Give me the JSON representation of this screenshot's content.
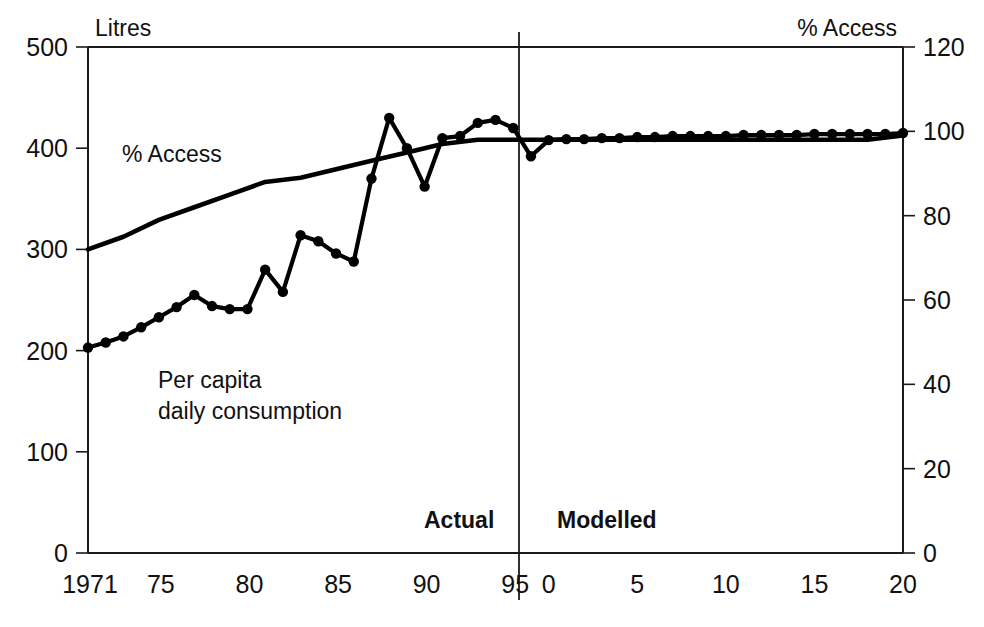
{
  "chart_data": {
    "type": "line",
    "title": "",
    "xlabel": "",
    "ylabel": "Litres",
    "y2label": "% Access",
    "ylim": [
      0,
      500
    ],
    "y2lim": [
      0,
      120
    ],
    "grid": false,
    "legend_position": "inline-annotation",
    "x_axis": {
      "actual_ticks": [
        "1971",
        "75",
        "80",
        "85",
        "90",
        "95"
      ],
      "modelled_ticks": [
        "0",
        "5",
        "10",
        "15",
        "20"
      ],
      "actual_tick_years": [
        1971,
        1975,
        1980,
        1985,
        1990,
        1995
      ],
      "modelled_tick_offsets": [
        0,
        5,
        10,
        15,
        20
      ],
      "divider_year": 1997,
      "range_years": [
        1971,
        2017
      ]
    },
    "y_axis_left": {
      "label": "Litres",
      "ticks": [
        0,
        100,
        200,
        300,
        400,
        500
      ]
    },
    "y_axis_right": {
      "label": "% Access",
      "ticks": [
        0,
        20,
        40,
        60,
        80,
        100,
        120
      ]
    },
    "annotations": [
      {
        "name": "percent-access-left",
        "text": "% Access"
      },
      {
        "name": "per-capita-line1",
        "text": "Per capita"
      },
      {
        "name": "per-capita-line2",
        "text": "daily consumption"
      },
      {
        "name": "phase-actual",
        "text": "Actual"
      },
      {
        "name": "phase-modelled",
        "text": "Modelled"
      }
    ],
    "series": [
      {
        "name": "Per capita daily consumption",
        "axis": "left",
        "unit": "Litres",
        "markers": true,
        "x": [
          1971,
          1972,
          1973,
          1974,
          1975,
          1976,
          1977,
          1978,
          1979,
          1980,
          1981,
          1982,
          1983,
          1984,
          1985,
          1986,
          1987,
          1988,
          1989,
          1990,
          1991,
          1992,
          1993,
          1994,
          1995,
          1996,
          1997,
          1998,
          1999,
          2000,
          2001,
          2002,
          2003,
          2004,
          2005,
          2006,
          2007,
          2008,
          2009,
          2010,
          2011,
          2012,
          2013,
          2014,
          2015,
          2016,
          2017
        ],
        "values": [
          203,
          208,
          214,
          223,
          233,
          243,
          255,
          244,
          241,
          241,
          280,
          258,
          314,
          308,
          296,
          288,
          370,
          430,
          400,
          362,
          410,
          412,
          425,
          428,
          420,
          392,
          408,
          409,
          409,
          410,
          410,
          411,
          411,
          412,
          412,
          412,
          412,
          413,
          413,
          413,
          413,
          414,
          414,
          414,
          414,
          414,
          415
        ]
      },
      {
        "name": "% Access",
        "axis": "right",
        "unit": "%",
        "markers": false,
        "x": [
          1971,
          1973,
          1975,
          1977,
          1979,
          1981,
          1983,
          1985,
          1987,
          1989,
          1991,
          1993,
          1995,
          1997,
          1999,
          2001,
          2003,
          2005,
          2007,
          2009,
          2011,
          2013,
          2015,
          2017
        ],
        "values": [
          72,
          75,
          79,
          82,
          85,
          88,
          89,
          91,
          93,
          95,
          97,
          98,
          98,
          98,
          98,
          98,
          98,
          98,
          98,
          98,
          98,
          98,
          98,
          99
        ]
      }
    ]
  }
}
